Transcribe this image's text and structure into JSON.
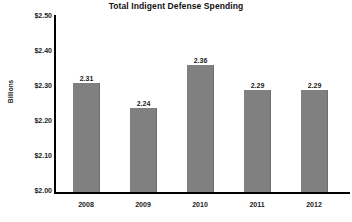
{
  "chart_data": {
    "type": "bar",
    "title": "Total Indigent Defense Spending",
    "xlabel": "",
    "ylabel": "Billions",
    "categories": [
      "2008",
      "2009",
      "2010",
      "2011",
      "2012"
    ],
    "values": [
      2.31,
      2.24,
      2.36,
      2.29,
      2.29
    ],
    "data_labels": [
      "2.31",
      "2.24",
      "2.36",
      "2.29",
      "2.29"
    ],
    "ylim": [
      2.0,
      2.5
    ],
    "ytick_step": 0.1,
    "ytick_labels": [
      "$2.50",
      "$2.40",
      "$2.30",
      "$2.20",
      "$2.10",
      "$2.00"
    ],
    "ytick_values": [
      2.5,
      2.4,
      2.3,
      2.2,
      2.1,
      2.0
    ],
    "grid": false,
    "legend": false,
    "legend_position": "none",
    "series": [
      {
        "name": "Total Indigent Defense Spending",
        "values": [
          2.31,
          2.24,
          2.36,
          2.29,
          2.29
        ],
        "color": "#808080"
      }
    ],
    "colors": {
      "bar": "#808080",
      "bar_edge": "#6e6e6e",
      "axis": "#000000",
      "text": "#1a1a1a",
      "background": "#ffffff"
    }
  }
}
